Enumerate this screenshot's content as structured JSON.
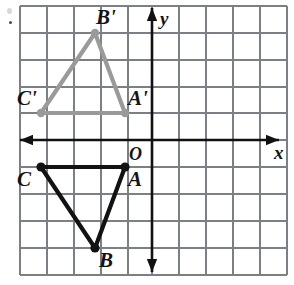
{
  "figure": {
    "type": "geometry-diagram",
    "background_color": "#ffffff",
    "canvas": {
      "width": 294,
      "height": 285
    }
  },
  "grid": {
    "color": "#7b7f86",
    "cell_size_px": 27,
    "left_px": 20,
    "right_px": 287,
    "top_px": 6,
    "bottom_px": 275,
    "vertical_lines_px": [
      20,
      47,
      74,
      101,
      128,
      152,
      179,
      206,
      233,
      260,
      287
    ],
    "horizontal_lines_px": [
      6,
      33,
      60,
      87,
      113,
      140,
      167,
      194,
      221,
      248,
      275
    ],
    "visible": true
  },
  "axes": {
    "color": "#111111",
    "x_axis": {
      "label": "x",
      "label_x_px": 274,
      "label_y_px": 143,
      "y_px": 140,
      "start_px": 20,
      "end_px": 279,
      "arrows": "both"
    },
    "y_axis": {
      "label": "y",
      "label_x_px": 160,
      "label_y_px": 9,
      "x_px": 152,
      "start_px": 8,
      "end_px": 272,
      "arrows": "both"
    },
    "origin": {
      "label": "O",
      "label_x_px": 129,
      "label_y_px": 145,
      "x_px": 152,
      "y_px": 140
    }
  },
  "shapes": [
    {
      "name": "triangle-image-prime",
      "id": "primed",
      "color": "#9a9a9a",
      "stroke_width": 4.2,
      "vertex_radius": 4.2,
      "closed": true,
      "vertices": [
        {
          "label": "A'",
          "x_px": 125,
          "y_px": 113,
          "grid_x": -1,
          "grid_y": 1,
          "label_x_px": 128,
          "label_y_px": 88
        },
        {
          "label": "B'",
          "x_px": 95,
          "y_px": 33,
          "grid_x": -2,
          "grid_y": 4,
          "label_x_px": 96,
          "label_y_px": 7
        },
        {
          "label": "C'",
          "x_px": 41,
          "y_px": 113,
          "grid_x": -4,
          "grid_y": 1,
          "label_x_px": 17,
          "label_y_px": 88
        }
      ]
    },
    {
      "name": "triangle-preimage",
      "id": "plain",
      "color": "#121212",
      "stroke_width": 4.2,
      "vertex_radius": 4.6,
      "closed": true,
      "vertices": [
        {
          "label": "A",
          "x_px": 125,
          "y_px": 167,
          "grid_x": -1,
          "grid_y": -1,
          "label_x_px": 128,
          "label_y_px": 169
        },
        {
          "label": "B",
          "x_px": 95,
          "y_px": 248,
          "grid_x": -2,
          "grid_y": -4,
          "label_x_px": 99,
          "label_y_px": 250
        },
        {
          "label": "C",
          "x_px": 41,
          "y_px": 167,
          "grid_x": -4,
          "grid_y": -1,
          "label_x_px": 17,
          "label_y_px": 169
        }
      ]
    }
  ],
  "artifacts": {
    "top_left_dot": {
      "x_px": 9,
      "y_px": 21
    },
    "top_left_smudge": {
      "x_px": 7,
      "y_px": 8
    }
  }
}
